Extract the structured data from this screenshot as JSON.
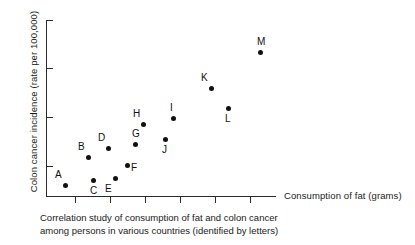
{
  "chart_data": {
    "type": "scatter",
    "title": "",
    "xlabel": "Consumption of fat (grams)",
    "ylabel": "Colon cancer incidence (rate per 100,000)",
    "grid": false,
    "legend": "none",
    "xlim": [
      0,
      100
    ],
    "ylim": [
      0,
      100
    ],
    "xticks_count": 6,
    "yticks_count": 4,
    "axis_tick_labels": [],
    "points": [
      {
        "label": "A",
        "x": 8.3,
        "y": 6.2,
        "label_position": "above-left",
        "px": 65,
        "py": 185
      },
      {
        "label": "B",
        "x": 18.3,
        "y": 22.0,
        "label_position": "above-left",
        "px": 88,
        "py": 157
      },
      {
        "label": "C",
        "x": 20.4,
        "y": 9.0,
        "label_position": "below",
        "px": 93,
        "py": 180
      },
      {
        "label": "D",
        "x": 27.0,
        "y": 27.1,
        "label_position": "above-left",
        "px": 108,
        "py": 148
      },
      {
        "label": "E",
        "x": 30.0,
        "y": 10.2,
        "label_position": "below-left",
        "px": 115,
        "py": 178
      },
      {
        "label": "F",
        "x": 35.2,
        "y": 17.5,
        "label_position": "right",
        "px": 127,
        "py": 165
      },
      {
        "label": "G",
        "x": 38.7,
        "y": 29.4,
        "label_position": "above",
        "px": 135,
        "py": 144
      },
      {
        "label": "H",
        "x": 42.2,
        "y": 40.7,
        "label_position": "above-left",
        "px": 143,
        "py": 124
      },
      {
        "label": "I",
        "x": 55.2,
        "y": 44.1,
        "label_position": "above",
        "px": 173,
        "py": 118
      },
      {
        "label": "J",
        "x": 51.7,
        "y": 32.2,
        "label_position": "below",
        "px": 165,
        "py": 139
      },
      {
        "label": "K",
        "x": 71.7,
        "y": 61.0,
        "label_position": "above-left",
        "px": 211,
        "py": 88
      },
      {
        "label": "L",
        "x": 79.1,
        "y": 49.7,
        "label_position": "below",
        "px": 228,
        "py": 108
      },
      {
        "label": "M",
        "x": 93.0,
        "y": 81.4,
        "label_position": "above",
        "px": 260,
        "py": 52
      }
    ],
    "x_tick_px": [
      75,
      110,
      145,
      180,
      215,
      250
    ],
    "y_tick_px": [
      20,
      68,
      117,
      166
    ]
  },
  "caption": {
    "line1": "Correlation study of consumption of fat and colon cancer",
    "line2": "among persons in various countries (identified by letters)"
  }
}
